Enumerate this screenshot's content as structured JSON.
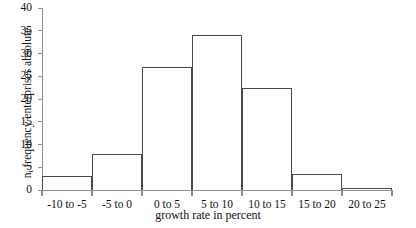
{
  "chart_data": {
    "type": "bar",
    "title": "",
    "subtitle": "",
    "xlabel": "growth rate in percent",
    "ylabel_prefix": "n",
    "ylabel_subscript": "i",
    "ylabel_rest": " frequency enterprises absolute",
    "ylabel": "ni frequency enterprises absolute",
    "categories": [
      "-10 to -5",
      "-5 to 0",
      "0 to 5",
      "5 to 10",
      "10 to 15",
      "15 to 20",
      "20 to 25"
    ],
    "values": [
      3,
      8,
      27,
      34,
      22.5,
      3.5,
      0.5
    ],
    "ylim": [
      0,
      40
    ],
    "ytick_values": [
      0,
      5,
      10,
      15,
      20,
      25,
      30,
      35,
      40
    ],
    "ytick_labels": [
      "0",
      "5",
      "10",
      "15",
      "20",
      "25",
      "30",
      "35",
      "40"
    ],
    "grid": false,
    "legend": false,
    "bar_fill_color": "#ffffff",
    "bar_edge_color": "#4a4a4a",
    "axis_color": "#8d8d8d",
    "text_color": "#111111"
  }
}
